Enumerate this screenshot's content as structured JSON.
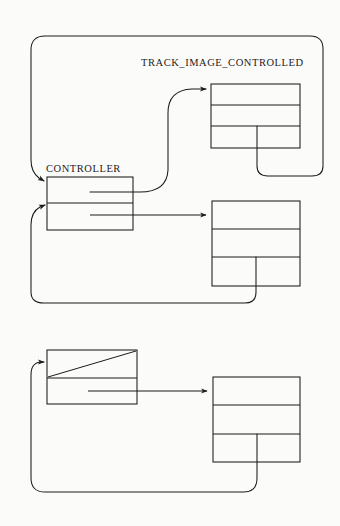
{
  "diagram": {
    "title": "",
    "background_color": "#fbfbfa",
    "line_color": "#1b1b1b",
    "labels": {
      "track_image_controlled": "TRACK_IMAGE_CONTROLLED",
      "controller": "CONTROLLER"
    },
    "label_positions": {
      "track_image_controlled": {
        "x": 141,
        "y": 66
      },
      "controller": {
        "x": 46,
        "y": 172
      }
    },
    "nodes": [
      {
        "id": "controller-node",
        "name": "controller-node",
        "label": "CONTROLLER",
        "x": 47,
        "y": 177,
        "width": 86,
        "height": 53,
        "cells": 2,
        "dividers": [
          203
        ],
        "null_slash": false
      },
      {
        "id": "track-image-controlled-node",
        "name": "track-image-controlled-node",
        "label": "TRACK_IMAGE_CONTROLLED",
        "x": 211,
        "y": 84,
        "width": 89,
        "height": 64,
        "cells": 3,
        "dividers": [
          105,
          126
        ],
        "null_slash": false
      },
      {
        "id": "second-target-node",
        "name": "second-target-node",
        "label": "",
        "x": 212,
        "y": 201,
        "width": 88,
        "height": 85,
        "cells": 3,
        "dividers": [
          229,
          257
        ],
        "null_slash": false
      },
      {
        "id": "bottom-controller-node",
        "name": "bottom-controller-node",
        "label": "",
        "x": 47,
        "y": 350,
        "width": 90,
        "height": 54,
        "cells": 2,
        "dividers": [
          378
        ],
        "null_slash": true
      },
      {
        "id": "bottom-target-node",
        "name": "bottom-target-node",
        "label": "",
        "x": 213,
        "y": 377,
        "width": 87,
        "height": 85,
        "cells": 3,
        "dividers": [
          405,
          434
        ],
        "null_slash": false
      }
    ],
    "connections": [
      {
        "id": "controller-cell1-to-track-image",
        "name": "pointer-controller-to-track-image",
        "from": "controller-node.cell1",
        "to": "track-image-controlled-node.cell1",
        "style": "s-curve",
        "arrowhead": true
      },
      {
        "id": "controller-cell2-to-second-target",
        "name": "pointer-controller-to-second-target",
        "from": "controller-node.cell2",
        "to": "second-target-node.cell1",
        "style": "straight",
        "arrowhead": true
      },
      {
        "id": "track-image-backlink",
        "name": "backlink-track-image-to-controller",
        "from": "track-image-controlled-node.cell3",
        "to": "controller-node.cell1",
        "style": "rounded-loop-outer",
        "arrowhead": true
      },
      {
        "id": "second-target-backlink",
        "name": "backlink-second-target-to-controller",
        "from": "second-target-node.cell3",
        "to": "controller-node.cell2",
        "style": "rounded-loop-lower",
        "arrowhead": true
      },
      {
        "id": "bottom-controller-to-bottom-target",
        "name": "pointer-bottom-controller-to-bottom-target",
        "from": "bottom-controller-node.cell2",
        "to": "bottom-target-node.cell1",
        "style": "straight",
        "arrowhead": true
      },
      {
        "id": "bottom-target-backlink",
        "name": "backlink-bottom-target-to-bottom-controller",
        "from": "bottom-target-node.cell3",
        "to": "bottom-controller-node.cell1",
        "style": "rounded-loop-bottom",
        "arrowhead": true
      }
    ]
  }
}
